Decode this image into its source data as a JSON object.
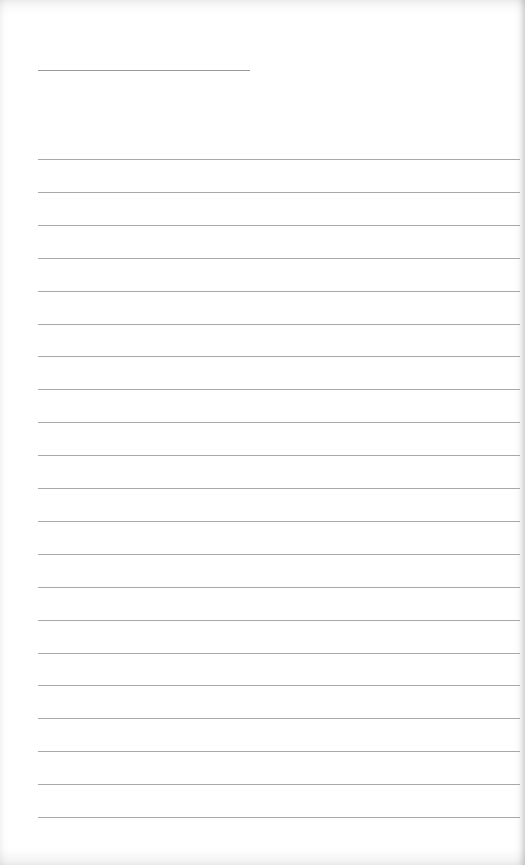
{
  "image": {
    "description": "Blank ruled notebook paper",
    "background_color": "#ffffff",
    "line_color": "#a8a8a8"
  },
  "title_line": {
    "x1": 38,
    "x2": 250,
    "y": 70
  },
  "rules": {
    "count": 21,
    "x1": 38,
    "x2": 520,
    "first_y": 159,
    "spacing": 32.9
  },
  "text_content": []
}
